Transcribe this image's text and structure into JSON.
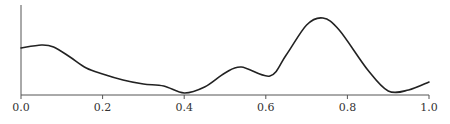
{
  "chart_data": {
    "type": "line",
    "title": "",
    "xlabel": "",
    "ylabel": "",
    "xlim": [
      0.0,
      1.0
    ],
    "ylim": [
      0,
      90
    ],
    "grid": false,
    "legend": null,
    "x_ticks": [
      "0.0",
      "0.2",
      "0.4",
      "0.6",
      "0.8",
      "1.0"
    ],
    "y_ticks": [],
    "series": [
      {
        "name": "density",
        "color": "#222222",
        "x": [
          0.0,
          0.05,
          0.08,
          0.12,
          0.16,
          0.2,
          0.25,
          0.3,
          0.35,
          0.4,
          0.45,
          0.5,
          0.54,
          0.61,
          0.65,
          0.7,
          0.74,
          0.78,
          0.85,
          0.9,
          0.95,
          1.0
        ],
        "y": [
          47,
          50,
          48,
          38,
          27,
          21,
          15,
          11,
          9,
          2,
          8,
          22,
          28,
          19,
          40,
          70,
          77,
          65,
          25,
          4,
          5,
          13
        ]
      }
    ]
  }
}
